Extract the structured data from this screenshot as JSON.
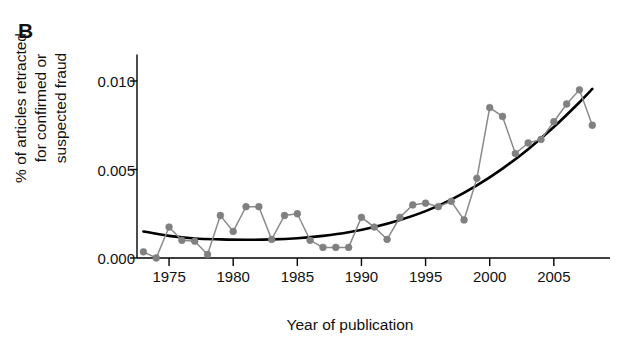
{
  "panel": {
    "label": "B"
  },
  "chart_data": {
    "type": "line",
    "title": "",
    "subtitle": "",
    "xlabel": "Year of publication",
    "ylabel": "% of articles retracted\nfor confirmed or\nsuspected fraud",
    "xlim": [
      1972.5,
      2008.6
    ],
    "ylim": [
      0.0,
      0.0115
    ],
    "xticks": [
      1975,
      1980,
      1985,
      1990,
      1995,
      2000,
      2005
    ],
    "xtick_labels": [
      "1975",
      "1980",
      "1985",
      "1990",
      "1995",
      "2000",
      "2005"
    ],
    "yticks": [
      0.0,
      0.005,
      0.01
    ],
    "ytick_labels": [
      "0.000",
      "0.005",
      "0.010"
    ],
    "grid": false,
    "legend": false,
    "marker_color": "#808080",
    "line_color": "#8a8a8a",
    "trend_color": "#000000",
    "axis_color": "#000000",
    "series": [
      {
        "name": "Observed % retracted for fraud",
        "type": "line-markers",
        "x": [
          1973,
          1974,
          1975,
          1976,
          1977,
          1978,
          1979,
          1980,
          1981,
          1982,
          1983,
          1984,
          1985,
          1986,
          1987,
          1988,
          1989,
          1990,
          1991,
          1992,
          1993,
          1994,
          1995,
          1996,
          1997,
          1998,
          1999,
          2000,
          2001,
          2002,
          2003,
          2004,
          2005,
          2006,
          2007,
          2008
        ],
        "values": [
          0.00035,
          0.0,
          0.00175,
          0.001,
          0.00095,
          0.0002,
          0.0024,
          0.0015,
          0.0029,
          0.0029,
          0.00105,
          0.0024,
          0.0025,
          0.001,
          0.0006,
          0.0006,
          0.0006,
          0.0023,
          0.00175,
          0.00105,
          0.0023,
          0.003,
          0.0031,
          0.0029,
          0.0032,
          0.00215,
          0.0045,
          0.0085,
          0.008,
          0.0059,
          0.0065,
          0.0067,
          0.0077,
          0.0087,
          0.0095,
          0.0075
        ]
      },
      {
        "name": "Fitted trend",
        "type": "curve",
        "x": [
          1973,
          1975,
          1977,
          1979,
          1981,
          1983,
          1985,
          1987,
          1989,
          1991,
          1993,
          1995,
          1997,
          1999,
          2001,
          2003,
          2005,
          2007,
          2008
        ],
        "values": [
          0.0015,
          0.00125,
          0.0011,
          0.00105,
          0.00103,
          0.00105,
          0.00112,
          0.00125,
          0.00145,
          0.00175,
          0.00215,
          0.00265,
          0.0033,
          0.0041,
          0.00505,
          0.00615,
          0.0074,
          0.0088,
          0.00955
        ]
      }
    ]
  }
}
